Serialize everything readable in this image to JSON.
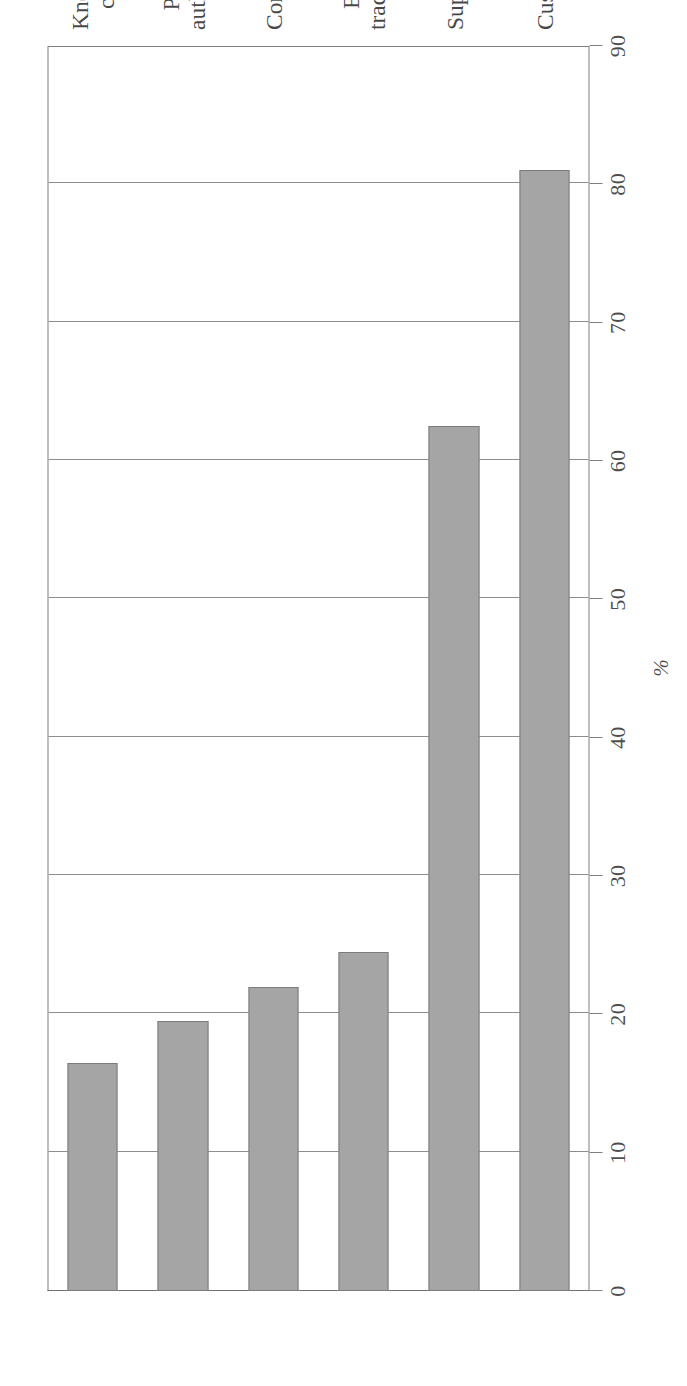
{
  "figure": {
    "axis_title": "%",
    "bar_fill": "#8c8c8c",
    "bar_stroke": "#585858",
    "grid_color": "#6e6e6e",
    "orientation": "rotated-90-ccw-horizontal-bars"
  },
  "chart_data": {
    "type": "bar",
    "title": "",
    "subtitle": "",
    "xlabel": "",
    "ylabel": "%",
    "orientation": "horizontal",
    "grid": true,
    "legend": false,
    "ylim": [
      0,
      90
    ],
    "axis_ticks": [
      "0",
      "10",
      "20",
      "30",
      "40",
      "50",
      "60",
      "70",
      "80",
      "90"
    ],
    "axis_tick_values": [
      0,
      10,
      20,
      30,
      40,
      50,
      60,
      70,
      80,
      90
    ],
    "categories": [
      "Customers",
      "Suppliers",
      "Education and trading institutions",
      "Consultants",
      "Public authorities",
      "Knowledge centres"
    ],
    "category_lines": [
      [
        "Customers"
      ],
      [
        "Suppliers"
      ],
      [
        "Education and",
        "trading institutions"
      ],
      [
        "Consultants"
      ],
      [
        "Public",
        "authorities"
      ],
      [
        "Knowledge",
        "centres"
      ]
    ],
    "values": [
      81,
      62.5,
      24.5,
      22,
      19.5,
      16.5
    ],
    "series": [
      {
        "name": "",
        "values": [
          81,
          62.5,
          24.5,
          22,
          19.5,
          16.5
        ]
      }
    ]
  },
  "ticks": [
    {
      "label": "0"
    },
    {
      "label": "10"
    },
    {
      "label": "20"
    },
    {
      "label": "30"
    },
    {
      "label": "40"
    },
    {
      "label": "50"
    },
    {
      "label": "60"
    },
    {
      "label": "70"
    },
    {
      "label": "80"
    },
    {
      "label": "90"
    }
  ],
  "bars": [
    {
      "category": "Customers",
      "value": 81,
      "line1": "Customers",
      "line2": ""
    },
    {
      "category": "Suppliers",
      "value": 62.5,
      "line1": "Suppliers",
      "line2": ""
    },
    {
      "category": "Education and trading institutions",
      "value": 24.5,
      "line1": "Education and",
      "line2": "trading institutions"
    },
    {
      "category": "Consultants",
      "value": 22,
      "line1": "Consultants",
      "line2": ""
    },
    {
      "category": "Public authorities",
      "value": 19.5,
      "line1": "Public",
      "line2": "authorities"
    },
    {
      "category": "Knowledge centres",
      "value": 16.5,
      "line1": "Knowledge",
      "line2": "centres"
    }
  ]
}
